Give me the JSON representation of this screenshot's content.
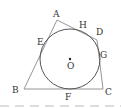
{
  "diagram": {
    "type": "quadrilateral-with-inscribed-circle",
    "colors": {
      "line": "#8a8a8a",
      "circle": "#555555",
      "text": "#333333",
      "dash": "#bbbbbb"
    },
    "vertices": {
      "A": {
        "label": "A",
        "x": 57,
        "y": 20
      },
      "B": {
        "label": "B",
        "x": 24,
        "y": 89
      },
      "C": {
        "label": "C",
        "x": 103,
        "y": 89
      },
      "D": {
        "label": "D",
        "x": 97,
        "y": 40
      }
    },
    "tangent_points": {
      "E": {
        "label": "E"
      },
      "H": {
        "label": "H"
      },
      "G": {
        "label": "G"
      },
      "F": {
        "label": "F"
      }
    },
    "center": {
      "label": "O",
      "x": 70,
      "y": 59
    },
    "radius": 30
  }
}
